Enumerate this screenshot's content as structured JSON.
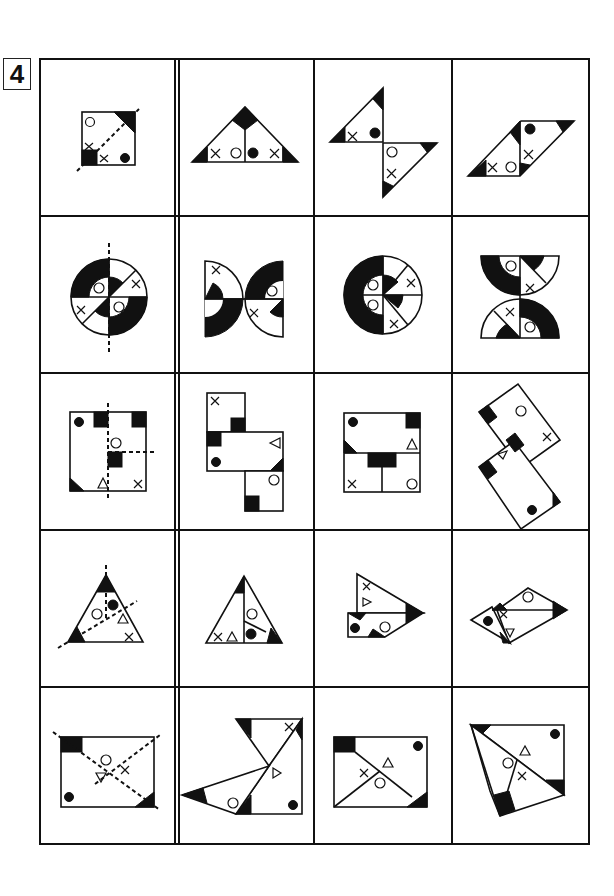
{
  "puzzle": {
    "number": "4",
    "grid": {
      "rows": 5,
      "columns": 4,
      "first_column_separator": "double-line"
    },
    "rows": [
      {
        "question": "square folded along diagonal (dashed line); symbols: circle, x, x, filled dot; black corner triangles/square",
        "options": [
          "triangle unfolded A",
          "bowtie hourglass B",
          "parallelogram C"
        ]
      },
      {
        "question": "circle with black arcs folded along vertical dashed line; symbols: circle, circle, x, x",
        "options": [
          "two half-discs facing outward A",
          "circle with C-shaped black band B",
          "hourglass of half-discs C"
        ]
      },
      {
        "question": "square with two dashed fold lines; symbols: filled dot, circle, triangle, x; black squares",
        "options": [
          "stepped rectangles A",
          "square with divided lower half B",
          "rotated rectangles C"
        ]
      },
      {
        "question": "triangle with two dashed fold lines; symbols: circle, filled dot, triangle, x",
        "options": [
          "triangle divided A",
          "arrow-shaped pieces B",
          "rhombus pieces C"
        ]
      },
      {
        "question": "rectangle with two dashed diagonal folds; symbols: circle, triangle, x, filled dot",
        "options": [
          "fan-shaped pieces A",
          "rectangle with crossing lines B",
          "quadrilateral with overlapping triangles C"
        ]
      }
    ],
    "symbols": {
      "circle": "○",
      "dot": "●",
      "cross": "×",
      "triangle": "△"
    }
  }
}
